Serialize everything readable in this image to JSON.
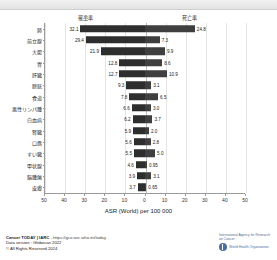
{
  "chart_data": {
    "type": "bar",
    "orientation": "horizontal-diverging",
    "title": "",
    "xlabel": "ASR (World) per 100 000",
    "ylabel": "",
    "xlim": [
      -50,
      50
    ],
    "xticks": [
      50,
      40,
      30,
      20,
      10,
      0,
      10,
      20,
      30,
      40,
      50
    ],
    "grid": true,
    "legend_position": "top",
    "categories": [
      "肺",
      "前立腺",
      "大腸",
      "胃",
      "肝臓",
      "膀胱",
      "食道",
      "悪性リンパ腫",
      "白血病",
      "腎臓",
      "口唇",
      "すい臓",
      "甲状腺",
      "脳腫瘍",
      "皮膚"
    ],
    "series": [
      {
        "name": "罹患率",
        "side": "left",
        "values": [
          32.1,
          29.4,
          21.9,
          12.8,
          12.7,
          9.3,
          7.8,
          6.6,
          6.2,
          5.9,
          5.6,
          5.5,
          4.6,
          3.9,
          3.7
        ]
      },
      {
        "name": "死亡率",
        "side": "right",
        "values": [
          24.8,
          7.3,
          9.9,
          8.6,
          10.9,
          3.1,
          6.5,
          3.0,
          3.7,
          2.0,
          2.8,
          5.0,
          0.95,
          3.1,
          0.65
        ]
      }
    ],
    "value_labels": {
      "left": [
        "32.1",
        "29.4",
        "21.9",
        "12.8",
        "12.7",
        "9.3",
        "7.8",
        "6.6",
        "6.2",
        "5.9",
        "5.6",
        "5.5",
        "4.6",
        "3.9",
        "3.7"
      ],
      "right": [
        "24.8",
        "7.3",
        "9.9",
        "8.6",
        "10.9",
        "3.1",
        "6.5",
        "3.0",
        "3.7",
        "2.0",
        "2.8",
        "5.0",
        "0.95",
        "3.1",
        "0.65"
      ]
    },
    "colors": {
      "incidence_bar": "#2e2e2e",
      "mortality_bar": "#3f3f3f",
      "grid": "#e4e4e4",
      "axis": "#9a9a9a"
    }
  },
  "legend": {
    "incidence": "罹患率",
    "mortality": "死亡率"
  },
  "footer": {
    "source_bold": "Cancer TODAY | IARC",
    "source_url": " - https://gco.iarc.who.int/today",
    "data_version": "Data version : Globocan 2022",
    "copyright": "© All Rights Reserved 2024"
  },
  "logos": {
    "iarc": "International Agency for Research on Cancer",
    "who": "World Health Organization"
  }
}
